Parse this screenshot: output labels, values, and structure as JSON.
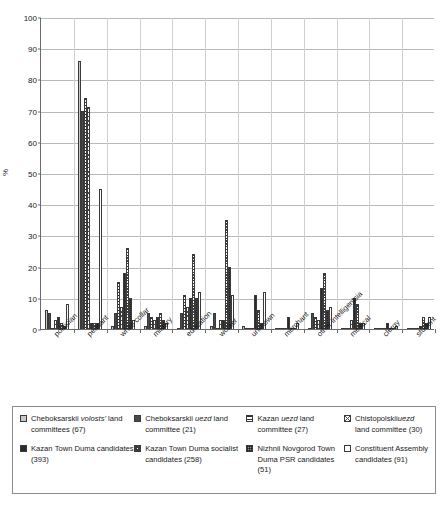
{
  "chart": {
    "title": "",
    "y_axis_title": "%",
    "y_ticks": [
      "0",
      "10",
      "20",
      "30",
      "40",
      "50",
      "60",
      "70",
      "80",
      "90",
      "100"
    ]
  },
  "chart_data": {
    "type": "bar",
    "title": "",
    "xlabel": "",
    "ylabel": "%",
    "ylim": [
      0,
      100
    ],
    "ytick_step": 10,
    "grid": true,
    "legend_position": "bottom",
    "categories": [
      "politician",
      "peasant",
      "white collar",
      "military",
      "education",
      "worker",
      "unknown",
      "merchant",
      "other intelligentsia",
      "medical",
      "clergy",
      "student"
    ],
    "series": [
      {
        "name": "Cheboksarskii volosts' land committees (67)",
        "pattern": "light-grey-solid",
        "values": [
          6,
          86,
          1,
          1,
          0,
          1,
          1,
          0,
          0,
          0,
          0,
          0
        ]
      },
      {
        "name": "Cheboksarskii uezd land committee (21)",
        "pattern": "dark-grey-solid",
        "values": [
          5,
          70,
          5,
          5,
          5,
          5,
          0,
          0,
          5,
          0,
          0,
          0
        ]
      },
      {
        "name": "Kazan uezd land committee (27)",
        "pattern": "horizontal-lines",
        "values": [
          0,
          74,
          15,
          4,
          11,
          0,
          0,
          0,
          4,
          0,
          0,
          0
        ]
      },
      {
        "name": "Chistopolskii uezd land committee (30)",
        "pattern": "cross-hatch-open",
        "values": [
          3,
          71,
          7,
          3,
          7,
          3,
          0,
          0,
          3,
          3,
          0,
          0
        ]
      },
      {
        "name": "Kazan Town Duma candidates (393)",
        "pattern": "black-solid",
        "values": [
          4,
          2,
          18,
          4,
          10,
          3,
          11,
          4,
          13,
          10,
          2,
          1
        ]
      },
      {
        "name": "Kazan Town Duma socialist candidates (258)",
        "pattern": "fine-cross-hatch",
        "values": [
          2,
          2,
          26,
          5,
          24,
          35,
          6,
          0,
          18,
          8,
          0,
          4
        ]
      },
      {
        "name": "Nizhnii Novgorod Town Duma PSR candidates (51)",
        "pattern": "grey-grid",
        "values": [
          1,
          2,
          10,
          3,
          10,
          20,
          2,
          0,
          6,
          2,
          0,
          2
        ]
      },
      {
        "name": "Constituent Assembly candidates (91)",
        "pattern": "white-open",
        "values": [
          8,
          45,
          3,
          2,
          12,
          11,
          12,
          2,
          7,
          2,
          1,
          4
        ]
      }
    ]
  },
  "legend": {
    "items": [
      {
        "swatch": "light-grey-solid",
        "line1": "Cheboksarskii ",
        "em1": "volosts'",
        "line2": "land committees (67)"
      },
      {
        "swatch": "dark-grey-solid",
        "line1": "Cheboksarskii ",
        "em1": "uezd",
        "line2": "land committee (21)"
      },
      {
        "swatch": "horizontal-lines",
        "line1": "Kazan ",
        "em1": "uezd",
        "line1b": " land",
        "line2": "committee (27)"
      },
      {
        "swatch": "cross-hatch-open",
        "line1": "Chistopolskii",
        "em1": "uezd",
        "line1b": " land",
        "line2": "committee (30)"
      },
      {
        "swatch": "black-solid",
        "line1": "Kazan Town Duma",
        "line2": "candidates (393)"
      },
      {
        "swatch": "fine-cross-hatch",
        "line1": "Kazan Town Duma",
        "line2": "socialist candidates",
        "line3": "(258)"
      },
      {
        "swatch": "grey-grid",
        "line1": "Nizhnii Novgorod",
        "line2": "Town Duma PSR",
        "line3": "candidates (51)"
      },
      {
        "swatch": "white-open",
        "line1": "Constituent",
        "line2": "Assembly",
        "line3": "candidates (91)"
      }
    ]
  }
}
